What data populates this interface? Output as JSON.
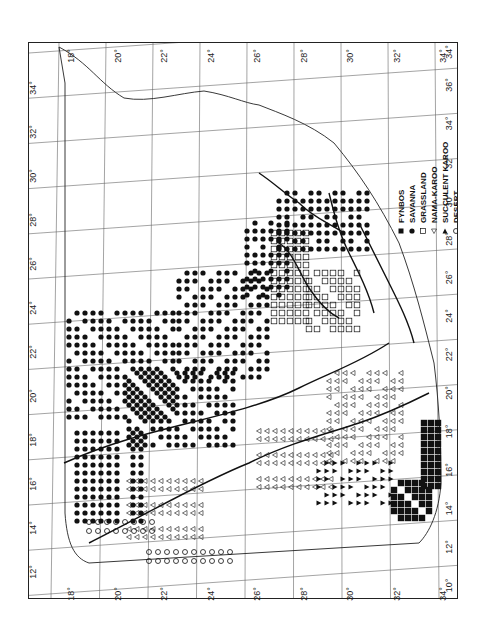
{
  "map": {
    "title": "Biome distribution map of southern Africa",
    "top_axis_labels": [
      "18°",
      "20°",
      "22°",
      "24°",
      "26°",
      "28°",
      "30°",
      "32°",
      "34°"
    ],
    "bottom_axis_labels": [
      "18°",
      "20°",
      "22°",
      "24°",
      "26°",
      "28°",
      "30°",
      "32°",
      "34°"
    ],
    "left_axis_labels": [
      "34°",
      "32°",
      "30°",
      "28°",
      "26°",
      "24°",
      "22°",
      "20°",
      "18°",
      "16°",
      "14°",
      "12°"
    ],
    "right_axis_labels": [
      "36°",
      "34°",
      "32°",
      "30°",
      "28°",
      "26°",
      "24°",
      "22°",
      "20°",
      "18°",
      "16°",
      "14°",
      "12°",
      "10°"
    ],
    "corner_top_right": "34°",
    "corner_bottom_right": "10°"
  },
  "legend": {
    "items": [
      {
        "symbol": "filled-square",
        "label": "FYNBOS"
      },
      {
        "symbol": "filled-circle",
        "label": "SAVANNA"
      },
      {
        "symbol": "open-square",
        "label": "GRASSLAND"
      },
      {
        "symbol": "open-triangle",
        "label": "NAMA-KAROO"
      },
      {
        "symbol": "filled-triangle",
        "label": "SUCCULENT KAROO"
      },
      {
        "symbol": "open-circle",
        "label": "DESERT"
      }
    ]
  },
  "colors": {
    "ink": "#111111",
    "grid": "#555555",
    "background": "#ffffff"
  }
}
